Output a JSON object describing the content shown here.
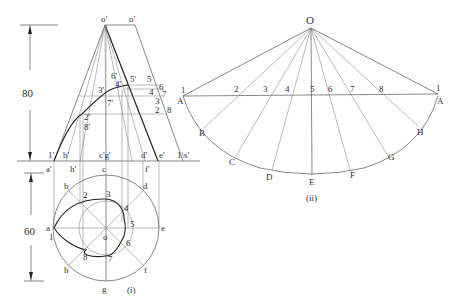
{
  "figure_i": {
    "caption": "(i)",
    "dimensions": {
      "height_label": "80",
      "diameter_label": "60"
    },
    "front_view": {
      "apex_labels": [
        "o'",
        "o'"
      ],
      "base_labels": {
        "one_prime": "1'",
        "a_prime": "a'",
        "b_prime": "b'",
        "h_prime": "h'",
        "cg_prime": "c'g'",
        "d_prime": "d'",
        "f_prime": "f'",
        "e_prime": "e'",
        "one_s_prime": "1\\s'"
      },
      "curve_labels": {
        "p2_8": "2'",
        "p8": "8'",
        "p3": "3'",
        "p7": "7'",
        "p4_6": "4'",
        "p6": "6'",
        "p5": "5'"
      },
      "true_length_labels": [
        "5",
        "6",
        "4",
        "7",
        "3",
        "2",
        "8"
      ]
    },
    "top_view": {
      "center_label": "o",
      "outer_points": [
        "a",
        "b",
        "c",
        "d",
        "e",
        "f",
        "g",
        "h"
      ],
      "helix_points": [
        "1",
        "2",
        "3",
        "4",
        "5",
        "6",
        "7",
        "8"
      ]
    }
  },
  "figure_ii": {
    "caption": "(ii)",
    "apex_label": "O",
    "arc_points": [
      "A",
      "B",
      "C",
      "D",
      "E",
      "F",
      "G",
      "H",
      "A"
    ],
    "chord_points": [
      "1",
      "2",
      "3",
      "4",
      "5",
      "6",
      "7",
      "8",
      "1"
    ]
  }
}
